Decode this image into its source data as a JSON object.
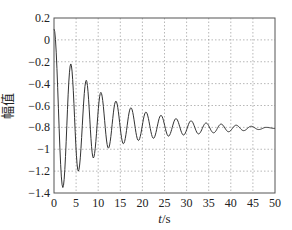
{
  "chart_data": {
    "type": "line",
    "title": "",
    "xlabel": "t/s",
    "xlabel_var": "t",
    "xlabel_unit": "/s",
    "ylabel": "幅值",
    "xlim": [
      0,
      50
    ],
    "ylim": [
      -1.4,
      0.2
    ],
    "xticks": [
      0,
      5,
      10,
      15,
      20,
      25,
      30,
      35,
      40,
      45,
      50
    ],
    "yticks": [
      0.2,
      0,
      -0.2,
      -0.4,
      -0.6,
      -0.8,
      -1,
      -1.2,
      -1.4
    ],
    "ytick_labels": [
      "0.2",
      "0",
      "−0.2",
      "−0.4",
      "−0.6",
      "−0.8",
      "−1",
      "−1.2",
      "−1.4"
    ],
    "grid": true,
    "legend": null,
    "series": [
      {
        "name": "response",
        "description": "damped oscillation settling to about -0.81",
        "extrema": {
          "t": [
            0,
            2.0,
            3.8,
            5.5,
            7.3,
            8.9,
            10.6,
            12.3,
            14.0,
            15.7,
            17.4,
            19.1,
            20.8,
            22.5,
            24.2,
            25.9,
            27.6,
            29.3,
            31.0,
            32.7,
            34.4,
            36.1,
            37.8,
            39.5,
            41.2,
            42.9,
            44.6,
            46.3,
            48.0,
            50.0
          ],
          "y": [
            0.1,
            -1.35,
            -0.22,
            -1.2,
            -0.37,
            -1.08,
            -0.48,
            -0.99,
            -0.56,
            -0.95,
            -0.62,
            -0.92,
            -0.66,
            -0.9,
            -0.69,
            -0.88,
            -0.72,
            -0.87,
            -0.74,
            -0.86,
            -0.76,
            -0.85,
            -0.77,
            -0.84,
            -0.78,
            -0.83,
            -0.79,
            -0.82,
            -0.8,
            -0.81
          ]
        },
        "final_value": -0.81,
        "color": "#333333"
      }
    ]
  },
  "colors": {
    "line": "#333333",
    "axes": "#555555",
    "grid": "#888888",
    "background": "#ffffff"
  }
}
